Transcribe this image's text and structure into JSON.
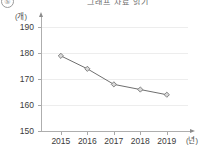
{
  "item_label": "⑤",
  "title_clipped": "그래프 자료 읽기",
  "axes": {
    "y_unit": "(개)",
    "x_unit": "(년)",
    "y_ticks": [
      150,
      160,
      170,
      180,
      190
    ],
    "x_ticks": [
      "2015",
      "2016",
      "2017",
      "2018",
      "2019"
    ]
  },
  "colors": {
    "line": "#6f6f6f",
    "marker_fill": "#d9d9d9",
    "marker_stroke": "#6a6a6a",
    "grid": "#ededed",
    "axis": "#aeaeae",
    "text": "#3b3b3b",
    "background": "#ffffff"
  },
  "chart_data": {
    "type": "line",
    "title": "그래프 자료 읽기",
    "xlabel": "(년)",
    "ylabel": "(개)",
    "categories": [
      "2015",
      "2016",
      "2017",
      "2018",
      "2019"
    ],
    "values": [
      179,
      174,
      168,
      166,
      164
    ],
    "series": [
      {
        "name": "개수",
        "values": [
          179,
          174,
          168,
          166,
          164
        ]
      }
    ],
    "ylim": [
      150,
      194
    ],
    "yticks": [
      150,
      160,
      170,
      180,
      190
    ],
    "grid": true,
    "legend": "none",
    "marker": "diamond"
  }
}
